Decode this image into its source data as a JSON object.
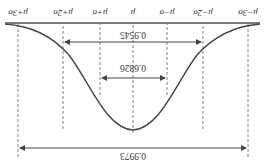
{
  "diagram": {
    "title": "",
    "orientation": "rotated-180",
    "ticks": [
      {
        "label": "μ−3σ",
        "x": 17
      },
      {
        "label": "μ−2σ",
        "x": 62
      },
      {
        "label": "μ−σ",
        "x": 98
      },
      {
        "label": "μ",
        "x": 132
      },
      {
        "label": "μ+σ",
        "x": 165
      },
      {
        "label": "μ+2σ",
        "x": 202
      },
      {
        "label": "μ+3σ",
        "x": 247
      }
    ],
    "intervals": [
      {
        "name": "one-sigma",
        "label": "0.6826",
        "from": "μ−σ",
        "to": "μ+σ"
      },
      {
        "name": "two-sigma",
        "label": "0.9545",
        "from": "μ−2σ",
        "to": "μ+2σ"
      },
      {
        "name": "three-sigma",
        "label": "0.9973",
        "from": "μ−3σ",
        "to": "μ+3σ"
      }
    ],
    "colors": {
      "line": "#444444",
      "dash": "#777777",
      "text": "#333333"
    }
  }
}
